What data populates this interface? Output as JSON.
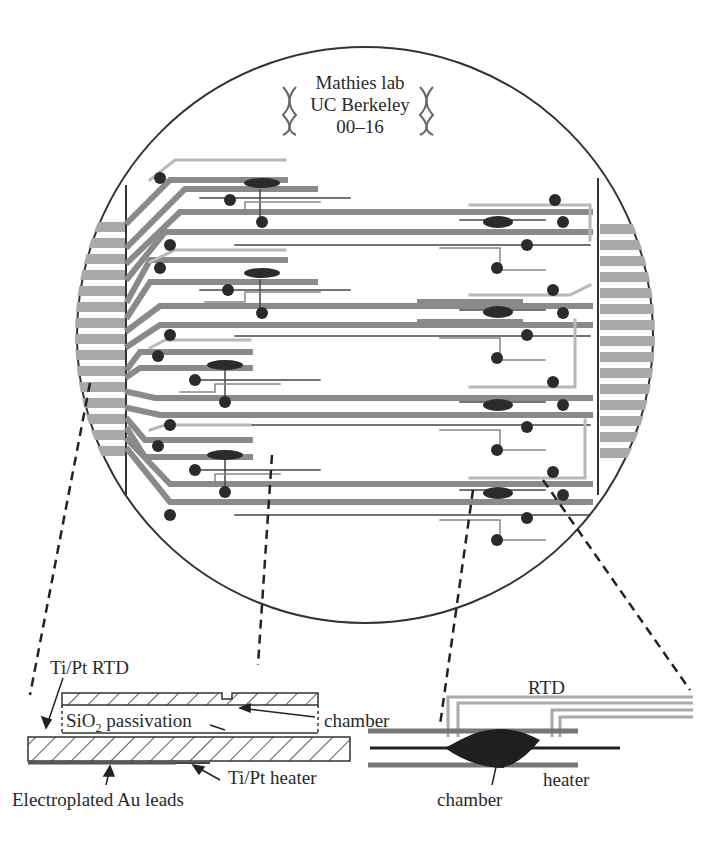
{
  "wafer": {
    "title_lines": [
      "Mathies lab",
      "UC Berkeley",
      "00–16"
    ],
    "dna_icon": "dna-helix-icon",
    "chip_count_left": 4,
    "chip_count_right": 4
  },
  "cross_section": {
    "labels": {
      "rtd": "Ti/Pt RTD",
      "passivation_prefix": "SiO",
      "passivation_sub": "2",
      "passivation_suffix": " passivation",
      "chamber": "chamber",
      "heater": "Ti/Pt heater",
      "leads": "Electroplated Au leads"
    }
  },
  "top_view": {
    "labels": {
      "rtd": "RTD",
      "heater": "heater",
      "chamber": "chamber"
    }
  },
  "colors": {
    "lead_gray": "#8a8a8a",
    "rtd_gray": "#b5b5b5",
    "dark": "#2b2b2b",
    "outline": "#333333"
  }
}
